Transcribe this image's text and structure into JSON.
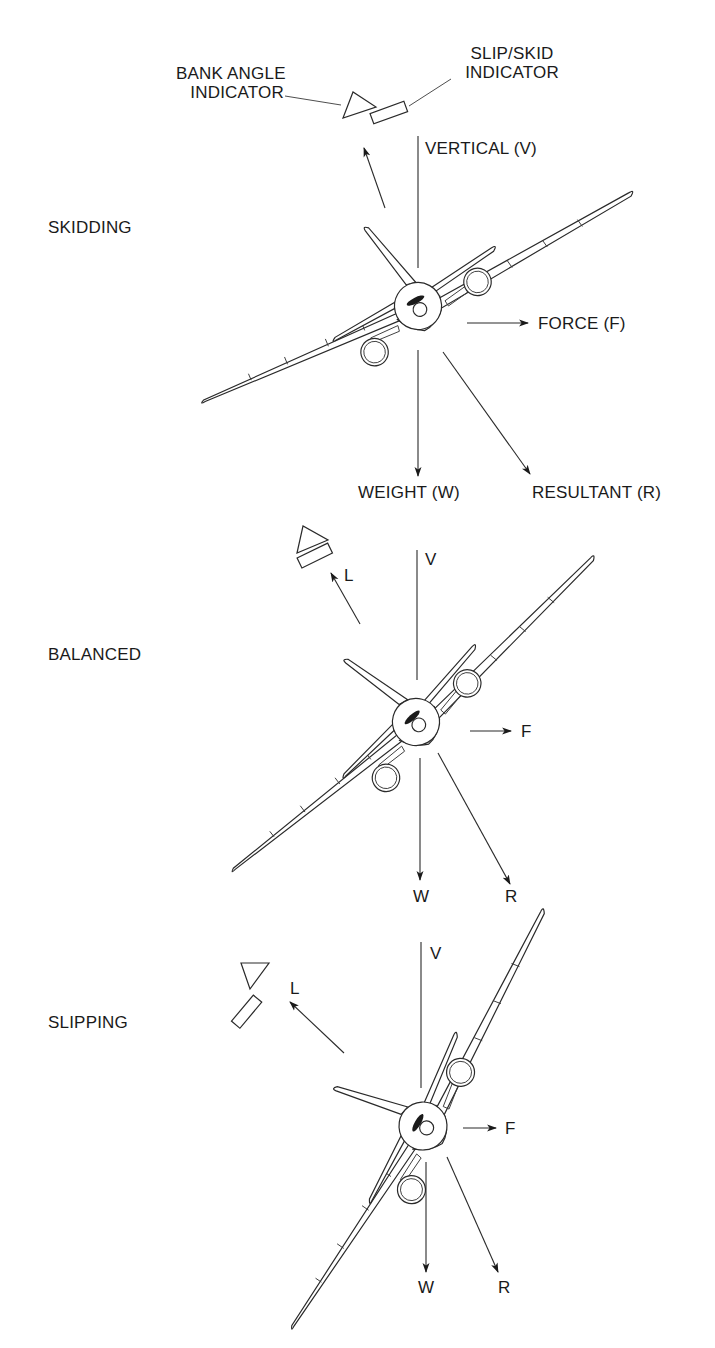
{
  "figure": {
    "colors": {
      "ink": "#1a1a1a",
      "background": "#ffffff"
    },
    "callouts": {
      "bank_angle_indicator": [
        "BANK ANGLE",
        "INDICATOR"
      ],
      "slip_skid_indicator": [
        "SLIP/SKID",
        "INDICATOR"
      ]
    },
    "panels": [
      {
        "id": "skidding",
        "title": "SKIDDING",
        "labels": {
          "vertical": "VERTICAL (V)",
          "force": "FORCE (F)",
          "weight": "WEIGHT (W)",
          "resultant": "RESULTANT (R)"
        },
        "bank_angle_deg": 15
      },
      {
        "id": "balanced",
        "title": "BALANCED",
        "labels": {
          "lift": "L",
          "vertical": "V",
          "force": "F",
          "weight": "W",
          "resultant": "R"
        },
        "bank_angle_deg": 30
      },
      {
        "id": "slipping",
        "title": "SLIPPING",
        "labels": {
          "lift": "L",
          "vertical": "V",
          "force": "F",
          "weight": "W",
          "resultant": "R"
        },
        "bank_angle_deg": 50
      }
    ]
  }
}
